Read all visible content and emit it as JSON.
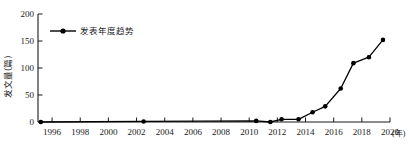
{
  "chart_data": {
    "type": "line",
    "title": "",
    "xlabel": "(年)",
    "ylabel": "发文量(篇)",
    "legend": [
      "发表年度趋势"
    ],
    "legend_position": "top-left-inside",
    "grid": false,
    "xlim": [
      1995,
      2020
    ],
    "ylim": [
      0,
      200
    ],
    "yticks": [
      0,
      50,
      100,
      150,
      200
    ],
    "ytick_labels": [
      "0",
      "50",
      "100",
      "150",
      "200"
    ],
    "xticks": [
      1996,
      1998,
      2000,
      2002,
      2004,
      2006,
      2008,
      2010,
      2012,
      2014,
      2016,
      2018,
      2020
    ],
    "xtick_labels": [
      "1996",
      "1998",
      "2000",
      "2002",
      "2004",
      "2006",
      "2008",
      "2010",
      "2012",
      "2014",
      "2016",
      "2018",
      "2020"
    ],
    "series": [
      {
        "name": "发表年度趋势",
        "color": "#000000",
        "marker": "circle",
        "x": [
          1995.2,
          2002.5,
          2010.5,
          2011.5,
          2012.3,
          2013.5,
          2014.5,
          2015.4,
          2016.5,
          2017.4,
          2018.5,
          2019.5
        ],
        "values": [
          0,
          1,
          2,
          0,
          5,
          5,
          18,
          29,
          62,
          109,
          120,
          152
        ]
      }
    ]
  },
  "axis": {
    "y_unit_label": "发文量(篇)",
    "x_unit_label": "(年)"
  },
  "legend": {
    "items": [
      {
        "label": "发表年度趋势",
        "color": "#000000"
      }
    ]
  }
}
